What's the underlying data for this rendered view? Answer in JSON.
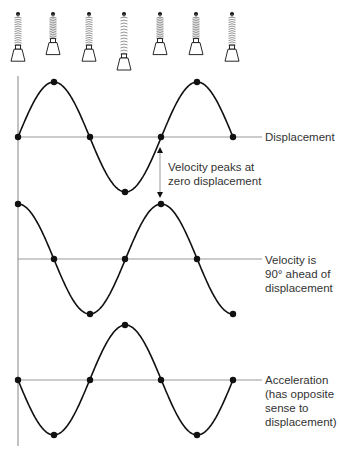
{
  "springs": {
    "count": 7,
    "x": [
      18,
      53,
      89,
      124,
      160,
      196,
      232
    ],
    "extension": [
      0.6,
      0.3,
      0.6,
      1.0,
      0.3,
      0.3,
      0.6
    ]
  },
  "waves": [
    {
      "name": "displacement",
      "label_lines": [
        "Displacement"
      ],
      "baseline_y": 137,
      "amplitude": 55,
      "phase": "sine",
      "points": [
        [
          18,
          137
        ],
        [
          54,
          82
        ],
        [
          90,
          137
        ],
        [
          125,
          192
        ],
        [
          161,
          137
        ],
        [
          197,
          82
        ],
        [
          233,
          137
        ]
      ]
    },
    {
      "name": "velocity",
      "label_lines": [
        "Velocity is",
        "90° ahead of",
        "displacement"
      ],
      "baseline_y": 259,
      "amplitude": 55,
      "phase": "cosine",
      "points": [
        [
          18,
          204
        ],
        [
          54,
          259
        ],
        [
          90,
          314
        ],
        [
          125,
          259
        ],
        [
          161,
          204
        ],
        [
          197,
          259
        ],
        [
          233,
          314
        ]
      ]
    },
    {
      "name": "acceleration",
      "label_lines": [
        "Acceleration",
        "(has opposite",
        "sense to",
        "displacement)"
      ],
      "baseline_y": 380,
      "amplitude": 55,
      "phase": "negative-sine",
      "points": [
        [
          18,
          380
        ],
        [
          54,
          435
        ],
        [
          90,
          380
        ],
        [
          125,
          325
        ],
        [
          161,
          380
        ],
        [
          197,
          435
        ],
        [
          233,
          380
        ]
      ]
    }
  ],
  "annotation": {
    "lines": [
      "Velocity peaks at",
      "zero displacement"
    ],
    "arrow_x": 160,
    "arrow_y1": 147,
    "arrow_y2": 198
  },
  "colors": {
    "curve": "#111111",
    "axis": "#999999",
    "text": "#333333",
    "spring": "#888888"
  }
}
